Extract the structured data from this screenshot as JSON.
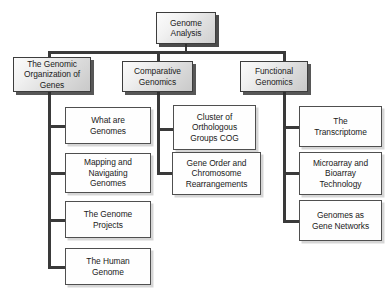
{
  "diagram": {
    "title": "Genome Analysis",
    "root": {
      "label": "Genome\nAnalysis"
    },
    "branches": [
      {
        "label": "The Genomic\nOrganization of\nGenes",
        "children": [
          {
            "label": "What are\nGenomes"
          },
          {
            "label": "Mapping and\nNavigating\nGenomes"
          },
          {
            "label": "The Genome\nProjects"
          },
          {
            "label": "The Human\nGenome"
          }
        ]
      },
      {
        "label": "Comparative\nGenomics",
        "children": [
          {
            "label": "Cluster of\nOrthologous\nGroups COG"
          },
          {
            "label": "Gene Order and\nChromosome\nRearrangements"
          }
        ]
      },
      {
        "label": "Functional\nGenomics",
        "children": [
          {
            "label": "The\nTranscriptome"
          },
          {
            "label": "Microarray and\nBioarray\nTechnology"
          },
          {
            "label": "Genomes as\nGene Networks"
          }
        ]
      }
    ],
    "colors": {
      "background": "#ffffff",
      "connector": "#3a3a3a",
      "box_border": "#4f4f4f",
      "leaf_fill": "#fefefe",
      "branch_fill_light": "#fbfbfb",
      "branch_fill_dark": "#c9c9c9",
      "text": "#1a1a1a"
    }
  }
}
